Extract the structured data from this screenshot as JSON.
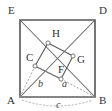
{
  "figure": {
    "kind": "geometry-diagram",
    "background_color": "#ffffff",
    "stroke_color": "#555555",
    "inner_stroke_color": "#5a5a5a",
    "dash_color": "#9a9a9a",
    "label_color": "#333333"
  },
  "vertices": [
    {
      "id": "E",
      "label": "E",
      "x": 20,
      "y": 20,
      "label_x": 8,
      "label_y": 14
    },
    {
      "id": "D",
      "label": "D",
      "x": 95,
      "y": 20,
      "label_x": 99,
      "label_y": 14
    },
    {
      "id": "A",
      "label": "A",
      "x": 20,
      "y": 97,
      "label_x": 7,
      "label_y": 104
    },
    {
      "id": "B",
      "label": "B",
      "x": 95,
      "y": 97,
      "label_x": 99,
      "label_y": 104
    },
    {
      "id": "H",
      "label": "H",
      "x": 48,
      "y": 43,
      "label_x": 52,
      "label_y": 37
    },
    {
      "id": "G",
      "label": "G",
      "x": 73,
      "y": 56,
      "label_x": 77,
      "label_y": 63
    },
    {
      "id": "C",
      "label": "C",
      "x": 35,
      "y": 66,
      "label_x": 26,
      "label_y": 61
    },
    {
      "id": "F",
      "label": "F",
      "x": 61,
      "y": 79,
      "label_x": 58,
      "label_y": 73
    }
  ],
  "side_labels": [
    {
      "id": "b",
      "label": "b",
      "x": 38,
      "y": 87
    },
    {
      "id": "a",
      "label": "a",
      "x": 62,
      "y": 87
    },
    {
      "id": "c",
      "label": "c",
      "x": 56,
      "y": 108
    }
  ],
  "outer_square": {
    "name": "AEDB",
    "points": "20,20 95,20 95,97 20,97"
  },
  "inner_square": {
    "name": "CHGF",
    "points": "35,66 48,43 73,56 61,79"
  },
  "diagonals": [
    {
      "id": "E-B",
      "from": "E",
      "to": "B",
      "x1": 20,
      "y1": 20,
      "x2": 95,
      "y2": 97
    },
    {
      "id": "A-D",
      "from": "A",
      "to": "D",
      "x1": 20,
      "y1": 97,
      "x2": 95,
      "y2": 20
    }
  ],
  "dashed_segments": [
    {
      "id": "A-C",
      "x1": 20,
      "y1": 97,
      "x2": 35,
      "y2": 66
    },
    {
      "id": "C-F",
      "x1": 35,
      "y1": 66,
      "x2": 61,
      "y2": 79
    },
    {
      "id": "F-B",
      "x1": 61,
      "y1": 79,
      "x2": 95,
      "y2": 97
    },
    {
      "id": "A-B",
      "x1": 20,
      "y1": 97,
      "x2": 95,
      "y2": 97
    }
  ],
  "arc": {
    "id": "arc-c",
    "path": "M 22 100 Q 57 112 93 100"
  },
  "right_angle_markers": [
    {
      "at": "C",
      "x": 35,
      "y": 66
    },
    {
      "at": "H",
      "x": 48,
      "y": 43
    },
    {
      "at": "G",
      "x": 73,
      "y": 56
    },
    {
      "at": "F",
      "x": 61,
      "y": 79
    }
  ]
}
